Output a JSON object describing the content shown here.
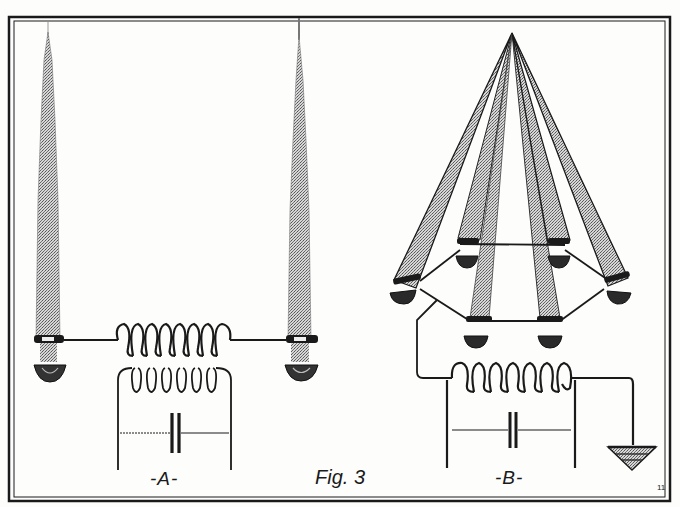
{
  "figure": {
    "title": "Fig. 3",
    "panels": [
      {
        "id": "A",
        "label": "-A-",
        "description": "Two vertical antenna rods joined by a coil, inductively coupled to a secondary coil with a capacitor"
      },
      {
        "id": "B",
        "label": "-B-",
        "description": "Six antenna rods converging to an apex, bases joined in a hexagonal ring, connected to a coil with capacitor and ground"
      }
    ],
    "corner_mark": "11",
    "colors": {
      "ink": "#1a1a1a",
      "paper": "#fdfdfc",
      "stipple": "#8a8a8a"
    }
  }
}
